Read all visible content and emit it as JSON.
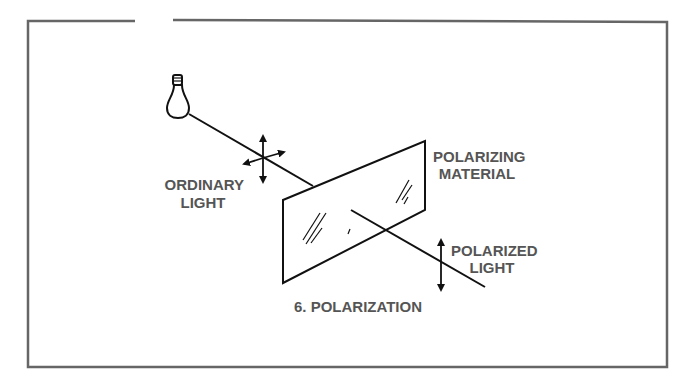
{
  "figure": {
    "caption": "6. POLARIZATION",
    "labels": {
      "ordinary_line1": "ORDINARY",
      "ordinary_line2": "LIGHT",
      "material_line1": "POLARIZING",
      "material_line2": "MATERIAL",
      "polarized_line1": "POLARIZED",
      "polarized_line2": "LIGHT"
    },
    "icons": [
      "light-bulb-icon",
      "unpolarized-arrows-icon",
      "vertical-polarization-arrow-icon"
    ],
    "colors": {
      "line": "#111111",
      "text": "#555555",
      "frame": "#666666",
      "background": "#ffffff"
    }
  }
}
